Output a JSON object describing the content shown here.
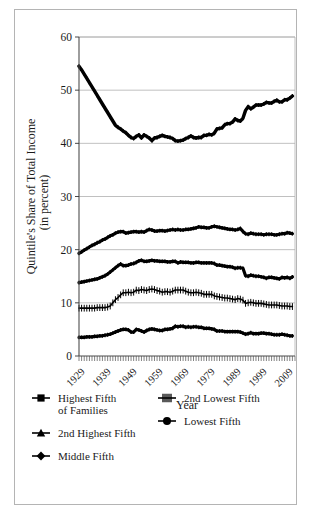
{
  "figure": {
    "frame_color": "#b4b4b4",
    "background": "#ffffff",
    "series_color": "#000000",
    "grid_color": "#b0b0b0"
  },
  "chart_data": {
    "type": "line",
    "title": "",
    "xlabel": "Year",
    "ylabel": "Quintile's Share of Total Income (in percent)",
    "ylabel_line1": "Quintile's Share of Total Income",
    "ylabel_line2": "(in percent)",
    "xlim": [
      1929,
      2012
    ],
    "ylim": [
      0,
      60
    ],
    "yticks": [
      0,
      10,
      20,
      30,
      40,
      50,
      60
    ],
    "ytick_labels": [
      "0",
      "10",
      "20",
      "30",
      "40",
      "50",
      "60"
    ],
    "xticks": [
      1929,
      1939,
      1949,
      1959,
      1969,
      1979,
      1989,
      1999,
      2009
    ],
    "xtick_labels": [
      "1929",
      "1939",
      "1949",
      "1959",
      "1969",
      "1979",
      "1989",
      "1999",
      "2009"
    ],
    "xtick_rotation": -45,
    "grid": "horizontal",
    "minor_xticks_every": 1,
    "legend_position": "below-plot",
    "x": [
      1929,
      1930,
      1931,
      1932,
      1933,
      1934,
      1935,
      1936,
      1937,
      1938,
      1939,
      1940,
      1941,
      1942,
      1943,
      1944,
      1945,
      1946,
      1947,
      1948,
      1949,
      1950,
      1951,
      1952,
      1953,
      1954,
      1955,
      1956,
      1957,
      1958,
      1959,
      1960,
      1961,
      1962,
      1963,
      1964,
      1965,
      1966,
      1967,
      1968,
      1969,
      1970,
      1971,
      1972,
      1973,
      1974,
      1975,
      1976,
      1977,
      1978,
      1979,
      1980,
      1981,
      1982,
      1983,
      1984,
      1985,
      1986,
      1987,
      1988,
      1989,
      1990,
      1991,
      1992,
      1993,
      1994,
      1995,
      1996,
      1997,
      1998,
      1999,
      2000,
      2001,
      2002,
      2003,
      2004,
      2005,
      2006,
      2007,
      2008,
      2009,
      2010,
      2011
    ],
    "series": [
      {
        "name": "Highest Fifth of Families",
        "legend_label_line1": "Highest Fifth",
        "legend_label_line2": "of Families",
        "marker": "square",
        "values": [
          54.5,
          53.8,
          53.0,
          52.2,
          51.4,
          50.6,
          49.8,
          49.0,
          48.2,
          47.4,
          46.6,
          45.8,
          45.0,
          44.2,
          43.4,
          43.0,
          42.7,
          42.3,
          42.0,
          41.5,
          41.1,
          40.9,
          41.3,
          41.6,
          41.0,
          41.6,
          41.3,
          41.0,
          40.5,
          41.0,
          41.1,
          41.3,
          41.5,
          41.3,
          41.2,
          41.1,
          40.9,
          40.5,
          40.4,
          40.5,
          40.6,
          40.9,
          41.1,
          41.4,
          41.1,
          41.0,
          41.1,
          41.1,
          41.5,
          41.5,
          41.7,
          41.6,
          41.9,
          42.7,
          42.8,
          42.9,
          43.5,
          43.7,
          43.7,
          44.0,
          44.6,
          44.3,
          44.2,
          44.7,
          46.2,
          46.9,
          46.5,
          46.8,
          47.2,
          47.2,
          47.2,
          47.4,
          47.7,
          47.6,
          47.6,
          47.9,
          48.1,
          47.8,
          47.8,
          48.2,
          48.2,
          48.5,
          48.9
        ],
        "start_value": 54.5,
        "min_value": 40.4,
        "end_value": 48.9
      },
      {
        "name": "2nd Highest Fifth",
        "legend_label": "2nd Highest Fifth",
        "marker": "triangle",
        "values": [
          19.3,
          19.6,
          19.9,
          20.2,
          20.5,
          20.8,
          21.0,
          21.3,
          21.5,
          21.8,
          22.0,
          22.3,
          22.6,
          22.8,
          23.1,
          23.3,
          23.4,
          23.4,
          23.1,
          23.2,
          23.3,
          23.4,
          23.4,
          23.3,
          23.4,
          23.3,
          23.6,
          23.8,
          23.7,
          23.5,
          23.5,
          23.6,
          23.6,
          23.5,
          23.6,
          23.7,
          23.8,
          23.7,
          23.8,
          23.7,
          23.7,
          23.8,
          23.8,
          23.9,
          24.0,
          24.1,
          24.3,
          24.2,
          24.2,
          24.1,
          24.1,
          24.3,
          24.4,
          24.3,
          24.2,
          24.1,
          24.0,
          23.9,
          23.8,
          23.8,
          23.7,
          23.8,
          24.0,
          23.4,
          23.0,
          22.9,
          23.1,
          23.0,
          22.9,
          22.9,
          22.9,
          22.8,
          22.9,
          22.9,
          22.9,
          22.8,
          22.8,
          22.9,
          23.0,
          23.0,
          23.2,
          23.1,
          23.0
        ],
        "start_value": 19.3,
        "max_value": 24.4,
        "end_value": 23.0
      },
      {
        "name": "Middle Fifth",
        "legend_label": "Middle Fifth",
        "marker": "diamond",
        "values": [
          13.8,
          13.9,
          14.0,
          14.1,
          14.2,
          14.3,
          14.4,
          14.5,
          14.7,
          14.9,
          15.1,
          15.4,
          15.8,
          16.2,
          16.6,
          17.0,
          17.3,
          17.0,
          17.0,
          17.1,
          17.3,
          17.4,
          17.6,
          17.9,
          18.0,
          17.8,
          17.8,
          17.9,
          18.0,
          17.9,
          17.9,
          17.8,
          17.8,
          17.8,
          17.7,
          17.7,
          17.8,
          17.8,
          17.5,
          17.7,
          17.6,
          17.6,
          17.6,
          17.5,
          17.5,
          17.6,
          17.6,
          17.5,
          17.5,
          17.5,
          17.5,
          17.5,
          17.4,
          17.1,
          17.1,
          17.0,
          16.9,
          16.8,
          16.8,
          16.7,
          16.5,
          16.6,
          16.6,
          16.5,
          15.1,
          15.0,
          15.2,
          15.1,
          15.0,
          15.0,
          14.9,
          14.8,
          14.6,
          14.8,
          14.8,
          14.7,
          14.6,
          14.5,
          14.8,
          14.7,
          14.8,
          14.6,
          14.9
        ],
        "start_value": 13.8,
        "max_value": 18.0,
        "end_value": 14.9
      },
      {
        "name": "2nd Lowest Fifth",
        "legend_label": "2nd Lowest Fifth",
        "marker": "hatch",
        "values": [
          9.0,
          9.0,
          9.0,
          9.0,
          9.0,
          9.0,
          9.0,
          9.1,
          9.1,
          9.1,
          9.1,
          9.2,
          9.4,
          10.0,
          10.6,
          11.0,
          11.5,
          11.9,
          11.9,
          12.0,
          11.9,
          12.0,
          12.4,
          12.3,
          12.5,
          12.4,
          12.3,
          12.5,
          12.6,
          12.5,
          12.3,
          12.2,
          12.0,
          12.1,
          12.1,
          12.0,
          12.2,
          12.4,
          12.4,
          12.4,
          12.4,
          12.2,
          12.0,
          11.9,
          11.9,
          12.0,
          11.9,
          11.8,
          11.6,
          11.6,
          11.6,
          11.6,
          11.3,
          11.2,
          11.1,
          11.0,
          10.9,
          10.9,
          10.8,
          10.7,
          10.6,
          10.8,
          10.7,
          10.5,
          9.9,
          10.0,
          10.1,
          10.0,
          9.9,
          9.9,
          9.9,
          9.8,
          9.7,
          9.6,
          9.6,
          9.6,
          9.6,
          9.5,
          9.4,
          9.4,
          9.4,
          9.3,
          9.3
        ],
        "start_value": 9.0,
        "max_value": 12.6,
        "end_value": 9.3
      },
      {
        "name": "Lowest Fifth",
        "legend_label": "Lowest Fifth",
        "marker": "circle",
        "values": [
          3.5,
          3.5,
          3.5,
          3.6,
          3.6,
          3.6,
          3.7,
          3.7,
          3.8,
          3.8,
          3.9,
          4.0,
          4.1,
          4.3,
          4.5,
          4.7,
          4.9,
          5.0,
          5.0,
          4.9,
          4.5,
          4.5,
          5.0,
          4.9,
          4.7,
          4.5,
          4.8,
          5.0,
          5.1,
          5.0,
          4.9,
          4.8,
          4.8,
          5.0,
          5.0,
          5.1,
          5.2,
          5.6,
          5.5,
          5.6,
          5.6,
          5.4,
          5.5,
          5.4,
          5.5,
          5.5,
          5.4,
          5.4,
          5.2,
          5.2,
          5.2,
          5.1,
          5.0,
          4.7,
          4.7,
          4.7,
          4.6,
          4.6,
          4.6,
          4.6,
          4.6,
          4.6,
          4.5,
          4.3,
          4.1,
          4.2,
          4.4,
          4.2,
          4.2,
          4.2,
          4.3,
          4.3,
          4.2,
          4.2,
          4.1,
          4.0,
          4.0,
          4.0,
          4.1,
          4.0,
          3.9,
          3.8,
          3.8
        ],
        "start_value": 3.5,
        "max_value": 5.6,
        "end_value": 3.8
      }
    ]
  },
  "legend": {
    "left_column": [
      {
        "label_line1": "Highest Fifth",
        "label_line2": "of Families",
        "marker": "square"
      },
      {
        "label_line1": "2nd Highest Fifth",
        "label_line2": "",
        "marker": "triangle"
      },
      {
        "label_line1": "Middle Fifth",
        "label_line2": "",
        "marker": "diamond"
      }
    ],
    "right_column": [
      {
        "label_line1": "2nd Lowest Fifth",
        "label_line2": "",
        "marker": "hatch"
      },
      {
        "label_line1": "Lowest Fifth",
        "label_line2": "",
        "marker": "circle"
      }
    ]
  }
}
